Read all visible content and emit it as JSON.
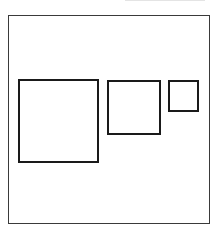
{
  "diagram": {
    "stroke_color": "#1a1a1a",
    "frame_color": "#3a3a3a",
    "background": "#ffffff",
    "frame": {
      "x": 8,
      "y": 15,
      "width": 202,
      "height": 209
    },
    "shapes": [
      {
        "name": "large-square",
        "x": 18,
        "y": 79,
        "width": 81,
        "height": 84
      },
      {
        "name": "medium-square",
        "x": 107,
        "y": 80,
        "width": 54,
        "height": 55
      },
      {
        "name": "small-square",
        "x": 168,
        "y": 80,
        "width": 31,
        "height": 32
      }
    ]
  }
}
